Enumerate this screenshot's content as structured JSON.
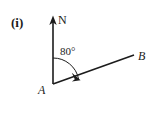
{
  "figure": {
    "part_label": "(i)",
    "background_color": "#ffffff",
    "ink_color": "#1c1c1c",
    "labels": {
      "north": "N",
      "vertex": "A",
      "endpoint": "B",
      "angle": "80°"
    },
    "geometry": {
      "vertex_point": {
        "x": 53,
        "y": 84
      },
      "north_tip": {
        "x": 53,
        "y": 17
      },
      "endpoint_point": {
        "x": 134,
        "y": 55
      },
      "angle_degrees": 80,
      "arc_radius": 26
    },
    "icons": {
      "north_arrowhead": "arrowhead-up-icon",
      "angle_arrowhead": "arrowhead-arc-icon"
    }
  }
}
